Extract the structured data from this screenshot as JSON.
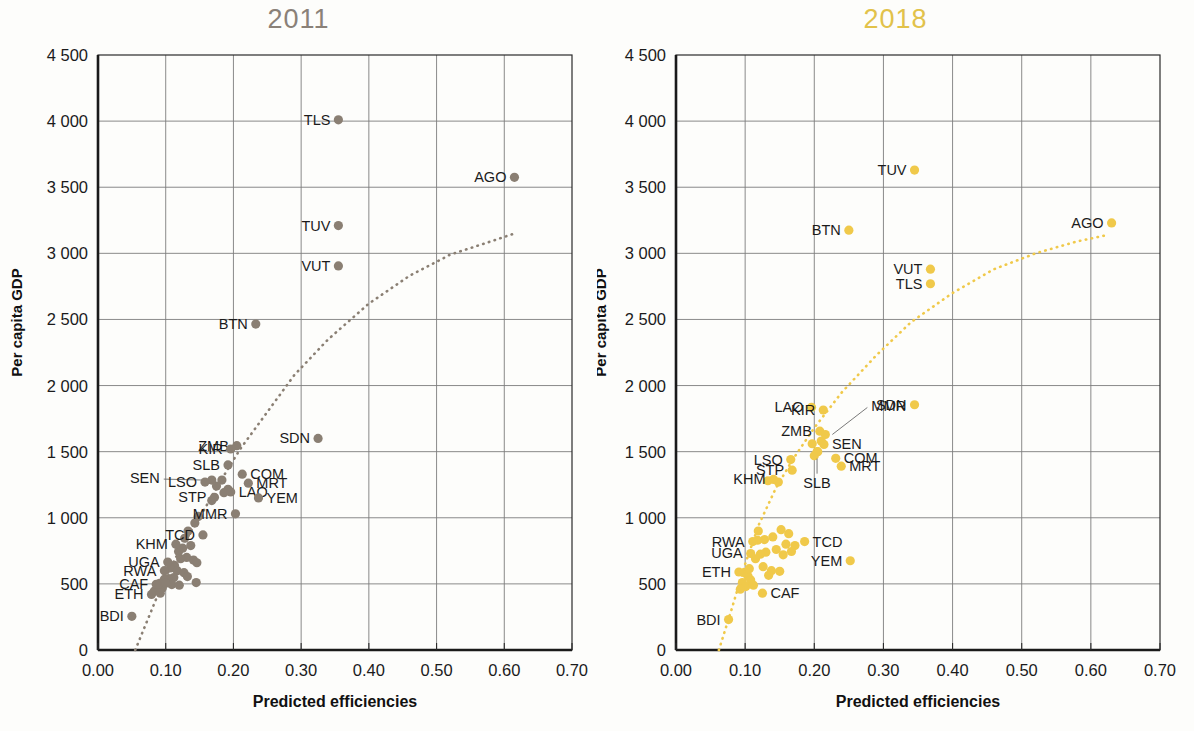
{
  "figure": {
    "shared_xlabel": "Predicted efficiencies",
    "shared_ylabel": "Per capita GDP",
    "xticks": [
      "0.00",
      "0.10",
      "0.20",
      "0.30",
      "0.40",
      "0.50",
      "0.60",
      "0.70"
    ],
    "yticks": [
      "0",
      "500",
      "1 000",
      "1 500",
      "2 000",
      "2 500",
      "3 000",
      "3 500",
      "4 000",
      "4 500"
    ],
    "colors": {
      "panel_2011_marker": "#8a7f73",
      "panel_2011_title": "#8a8178",
      "panel_2018_marker": "#f0c94a",
      "panel_2018_title": "#e2c24a",
      "grid": "#7d7d7d",
      "frame": "#2a2a2a",
      "text": "#1b1b1b"
    }
  },
  "chart_data": [
    {
      "type": "scatter",
      "title": "2011",
      "xlabel": "Predicted efficiencies",
      "ylabel": "Per capita GDP",
      "xlim": [
        0.0,
        0.7
      ],
      "ylim": [
        0,
        4500
      ],
      "xticks": [
        0.0,
        0.1,
        0.2,
        0.3,
        0.4,
        0.5,
        0.6,
        0.7
      ],
      "yticks": [
        0,
        500,
        1000,
        1500,
        2000,
        2500,
        3000,
        3500,
        4000,
        4500
      ],
      "grid": true,
      "legend": "none",
      "marker_color": "#8a7f73",
      "trendline": {
        "style": "dotted",
        "color": "#8a7f73",
        "points": [
          [
            0.055,
            0
          ],
          [
            0.075,
            250
          ],
          [
            0.095,
            500
          ],
          [
            0.12,
            750
          ],
          [
            0.15,
            1000
          ],
          [
            0.18,
            1270
          ],
          [
            0.21,
            1520
          ],
          [
            0.25,
            1800
          ],
          [
            0.29,
            2080
          ],
          [
            0.34,
            2350
          ],
          [
            0.4,
            2620
          ],
          [
            0.46,
            2830
          ],
          [
            0.52,
            2990
          ],
          [
            0.58,
            3090
          ],
          [
            0.615,
            3150
          ]
        ]
      },
      "labeled_points": [
        {
          "code": "TLS",
          "x": 0.355,
          "y": 4010,
          "label_pos": "left"
        },
        {
          "code": "AGO",
          "x": 0.615,
          "y": 3575,
          "label_pos": "left"
        },
        {
          "code": "TUV",
          "x": 0.355,
          "y": 3210,
          "label_pos": "left"
        },
        {
          "code": "VUT",
          "x": 0.355,
          "y": 2905,
          "label_pos": "left"
        },
        {
          "code": "BTN",
          "x": 0.233,
          "y": 2465,
          "label_pos": "left"
        },
        {
          "code": "SDN",
          "x": 0.325,
          "y": 1600,
          "label_pos": "left"
        },
        {
          "code": "ZMB",
          "x": 0.205,
          "y": 1545,
          "label_pos": "left"
        },
        {
          "code": "KIR",
          "x": 0.196,
          "y": 1520,
          "label_pos": "left"
        },
        {
          "code": "SLB",
          "x": 0.192,
          "y": 1400,
          "label_pos": "left"
        },
        {
          "code": "SEN",
          "x": 0.168,
          "y": 1285,
          "label_pos": "leader"
        },
        {
          "code": "COM",
          "x": 0.213,
          "y": 1330,
          "label_pos": "right"
        },
        {
          "code": "MRT",
          "x": 0.222,
          "y": 1262,
          "label_pos": "right"
        },
        {
          "code": "LSO",
          "x": 0.158,
          "y": 1270,
          "label_pos": "left"
        },
        {
          "code": "LAO",
          "x": 0.196,
          "y": 1195,
          "label_pos": "right"
        },
        {
          "code": "YEM",
          "x": 0.237,
          "y": 1150,
          "label_pos": "right"
        },
        {
          "code": "STP",
          "x": 0.172,
          "y": 1155,
          "label_pos": "left"
        },
        {
          "code": "MMR",
          "x": 0.203,
          "y": 1030,
          "label_pos": "left"
        },
        {
          "code": "TCD",
          "x": 0.155,
          "y": 870,
          "label_pos": "left"
        },
        {
          "code": "KHM",
          "x": 0.115,
          "y": 800,
          "label_pos": "left"
        },
        {
          "code": "UGA",
          "x": 0.103,
          "y": 665,
          "label_pos": "left"
        },
        {
          "code": "RWA",
          "x": 0.098,
          "y": 600,
          "label_pos": "left"
        },
        {
          "code": "CAF",
          "x": 0.086,
          "y": 497,
          "label_pos": "left"
        },
        {
          "code": "ETH",
          "x": 0.079,
          "y": 420,
          "label_pos": "left"
        },
        {
          "code": "BDI",
          "x": 0.05,
          "y": 255,
          "label_pos": "left"
        }
      ],
      "unlabeled_points": [
        [
          0.183,
          1285
        ],
        [
          0.175,
          1240
        ],
        [
          0.192,
          1215
        ],
        [
          0.186,
          1190
        ],
        [
          0.168,
          1130
        ],
        [
          0.148,
          1010
        ],
        [
          0.143,
          960
        ],
        [
          0.133,
          900
        ],
        [
          0.128,
          845
        ],
        [
          0.137,
          790
        ],
        [
          0.125,
          770
        ],
        [
          0.119,
          745
        ],
        [
          0.131,
          700
        ],
        [
          0.122,
          690
        ],
        [
          0.141,
          680
        ],
        [
          0.146,
          660
        ],
        [
          0.113,
          640
        ],
        [
          0.107,
          620
        ],
        [
          0.117,
          600
        ],
        [
          0.127,
          585
        ],
        [
          0.132,
          555
        ],
        [
          0.112,
          548
        ],
        [
          0.104,
          540
        ],
        [
          0.098,
          535
        ],
        [
          0.145,
          510
        ],
        [
          0.091,
          505
        ],
        [
          0.109,
          495
        ],
        [
          0.12,
          490
        ],
        [
          0.095,
          468
        ],
        [
          0.088,
          455
        ],
        [
          0.083,
          445
        ],
        [
          0.092,
          430
        ],
        [
          0.1,
          505
        ]
      ]
    },
    {
      "type": "scatter",
      "title": "2018",
      "xlabel": "Predicted efficiencies",
      "ylabel": "Per capita GDP",
      "xlim": [
        0.0,
        0.7
      ],
      "ylim": [
        0,
        4500
      ],
      "xticks": [
        0.0,
        0.1,
        0.2,
        0.3,
        0.4,
        0.5,
        0.6,
        0.7
      ],
      "yticks": [
        0,
        500,
        1000,
        1500,
        2000,
        2500,
        3000,
        3500,
        4000,
        4500
      ],
      "grid": true,
      "legend": "none",
      "marker_color": "#f0c94a",
      "trendline": {
        "style": "dotted",
        "color": "#f0c94a",
        "points": [
          [
            0.062,
            0
          ],
          [
            0.08,
            300
          ],
          [
            0.1,
            650
          ],
          [
            0.12,
            950
          ],
          [
            0.145,
            1230
          ],
          [
            0.17,
            1450
          ],
          [
            0.2,
            1680
          ],
          [
            0.24,
            1950
          ],
          [
            0.29,
            2230
          ],
          [
            0.34,
            2480
          ],
          [
            0.4,
            2700
          ],
          [
            0.46,
            2880
          ],
          [
            0.52,
            3000
          ],
          [
            0.58,
            3090
          ],
          [
            0.625,
            3140
          ]
        ]
      },
      "labeled_points": [
        {
          "code": "TUV",
          "x": 0.345,
          "y": 3630,
          "label_pos": "left"
        },
        {
          "code": "BTN",
          "x": 0.25,
          "y": 3175,
          "label_pos": "left"
        },
        {
          "code": "AGO",
          "x": 0.63,
          "y": 3230,
          "label_pos": "left"
        },
        {
          "code": "VUT",
          "x": 0.368,
          "y": 2880,
          "label_pos": "left"
        },
        {
          "code": "TLS",
          "x": 0.368,
          "y": 2770,
          "label_pos": "left"
        },
        {
          "code": "SDN",
          "x": 0.345,
          "y": 1855,
          "label_pos": "left"
        },
        {
          "code": "LAO",
          "x": 0.196,
          "y": 1835,
          "label_pos": "left"
        },
        {
          "code": "KIR",
          "x": 0.213,
          "y": 1815,
          "label_pos": "left"
        },
        {
          "code": "ZMB",
          "x": 0.208,
          "y": 1655,
          "label_pos": "left"
        },
        {
          "code": "MMR",
          "x": 0.216,
          "y": 1630,
          "label_pos": "leader"
        },
        {
          "code": "SEN",
          "x": 0.214,
          "y": 1555,
          "label_pos": "right"
        },
        {
          "code": "COM",
          "x": 0.231,
          "y": 1450,
          "label_pos": "right"
        },
        {
          "code": "MRT",
          "x": 0.239,
          "y": 1390,
          "label_pos": "right"
        },
        {
          "code": "LSO",
          "x": 0.166,
          "y": 1440,
          "label_pos": "left"
        },
        {
          "code": "STP",
          "x": 0.168,
          "y": 1360,
          "label_pos": "left"
        },
        {
          "code": "SLB",
          "x": 0.204,
          "y": 1500,
          "label_pos": "below"
        },
        {
          "code": "KHM",
          "x": 0.141,
          "y": 1290,
          "label_pos": "left"
        },
        {
          "code": "TCD",
          "x": 0.186,
          "y": 820,
          "label_pos": "right"
        },
        {
          "code": "YEM",
          "x": 0.252,
          "y": 675,
          "label_pos": "left"
        },
        {
          "code": "RWA",
          "x": 0.111,
          "y": 820,
          "label_pos": "left"
        },
        {
          "code": "UGA",
          "x": 0.108,
          "y": 730,
          "label_pos": "left"
        },
        {
          "code": "ETH",
          "x": 0.091,
          "y": 590,
          "label_pos": "left"
        },
        {
          "code": "CAF",
          "x": 0.125,
          "y": 430,
          "label_pos": "right"
        },
        {
          "code": "BDI",
          "x": 0.076,
          "y": 230,
          "label_pos": "left"
        }
      ],
      "unlabeled_points": [
        [
          0.205,
          1500
        ],
        [
          0.197,
          1560
        ],
        [
          0.21,
          1580
        ],
        [
          0.2,
          1470
        ],
        [
          0.133,
          1280
        ],
        [
          0.148,
          1270
        ],
        [
          0.152,
          910
        ],
        [
          0.163,
          880
        ],
        [
          0.14,
          855
        ],
        [
          0.128,
          835
        ],
        [
          0.118,
          830
        ],
        [
          0.159,
          800
        ],
        [
          0.172,
          790
        ],
        [
          0.145,
          760
        ],
        [
          0.13,
          740
        ],
        [
          0.122,
          725
        ],
        [
          0.155,
          720
        ],
        [
          0.167,
          745
        ],
        [
          0.115,
          690
        ],
        [
          0.126,
          630
        ],
        [
          0.138,
          600
        ],
        [
          0.15,
          595
        ],
        [
          0.099,
          585
        ],
        [
          0.104,
          560
        ],
        [
          0.108,
          530
        ],
        [
          0.096,
          510
        ],
        [
          0.101,
          480
        ],
        [
          0.093,
          460
        ],
        [
          0.106,
          615
        ],
        [
          0.134,
          565
        ],
        [
          0.112,
          490
        ],
        [
          0.119,
          900
        ]
      ]
    }
  ]
}
